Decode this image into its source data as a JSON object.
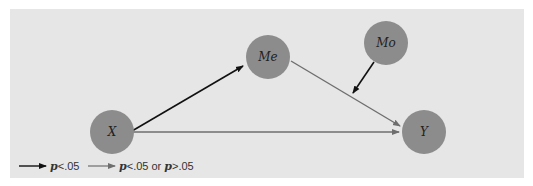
{
  "diagram": {
    "nodes": [
      {
        "id": "X",
        "label": "X"
      },
      {
        "id": "Me",
        "label": "Me"
      },
      {
        "id": "Mo",
        "label": "Mo"
      },
      {
        "id": "Y",
        "label": "Y"
      }
    ],
    "edges": [
      {
        "from": "X",
        "to": "Me",
        "style": "significant"
      },
      {
        "from": "Me",
        "to": "Y",
        "style": "mixed"
      },
      {
        "from": "X",
        "to": "Y",
        "style": "mixed"
      },
      {
        "from": "Mo",
        "to": "Me-Y path",
        "style": "significant"
      }
    ],
    "colors": {
      "node_fill": "#8c8c8c",
      "significant_edge": "#111111",
      "mixed_edge": "#6e6e6e",
      "background": "#e6e6e6"
    }
  },
  "legend": {
    "significant": {
      "p": "p",
      "text": "<.05"
    },
    "mixed": {
      "p1": "p",
      "text1": "<.05 or ",
      "p2": "p",
      "text2": ">.05"
    }
  }
}
